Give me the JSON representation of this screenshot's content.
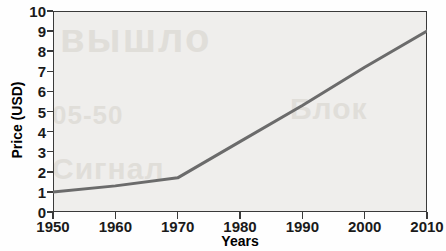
{
  "chart_data": {
    "type": "line",
    "title": "",
    "xlabel": "Years",
    "ylabel": "Price (USD)",
    "xlim": [
      1950,
      2010
    ],
    "ylim": [
      0,
      10
    ],
    "grid": false,
    "legend": null,
    "line_color": "#6b6b6b",
    "categories": [
      1950,
      1960,
      1970,
      1980,
      1990,
      2000,
      2010
    ],
    "x": [
      1950,
      1960,
      1970,
      1980,
      1990,
      2000,
      2010
    ],
    "values": [
      1.0,
      1.3,
      1.7,
      3.5,
      5.3,
      7.2,
      9.0
    ],
    "series": [
      {
        "name": "Price",
        "values": [
          1.0,
          1.3,
          1.7,
          3.5,
          5.3,
          7.2,
          9.0
        ]
      }
    ],
    "xticks": [
      "1950",
      "1960",
      "1970",
      "1980",
      "1990",
      "2000",
      "2010"
    ],
    "yticks": [
      "0",
      "1",
      "2",
      "3",
      "4",
      "5",
      "6",
      "7",
      "8",
      "9",
      "10"
    ],
    "ytick_values": [
      0,
      1,
      2,
      3,
      4,
      5,
      6,
      7,
      8,
      9,
      10
    ]
  },
  "background_text": {
    "a": "вышло",
    "b": "05-50",
    "c": "Сигнал",
    "d": "Блок"
  }
}
